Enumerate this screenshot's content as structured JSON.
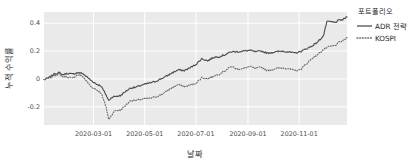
{
  "chart_data": {
    "type": "line",
    "title": "",
    "xlabel": "날짜",
    "ylabel": "누적 수익률",
    "legend_title": "포트폴리오",
    "legend_position": "right-outside",
    "grid": true,
    "grid_color": "#ffffff",
    "plot_bg": "#eaeaea",
    "figure_bg": "#ffffff",
    "xlim": [
      "2020-01-02",
      "2020-12-28"
    ],
    "ylim": [
      -0.33,
      0.48
    ],
    "yticks": [
      -0.2,
      0,
      0.2,
      0.4
    ],
    "ytick_labels": [
      "-0.2",
      "0",
      "0.2",
      "0.4"
    ],
    "xticks": [
      "2020-03-01",
      "2020-05-01",
      "2020-07-01",
      "2020-09-01",
      "2020-11-01"
    ],
    "xtick_labels": [
      "2020-03-01",
      "2020-05-01",
      "2020-07-01",
      "2020-09-01",
      "2020-11-01"
    ],
    "series": [
      {
        "name": "ADR 전략",
        "linestyle": "solid",
        "color": "#4f4f4f",
        "x": [
          "2020-01-02",
          "2020-01-08",
          "2020-01-14",
          "2020-01-20",
          "2020-01-24",
          "2020-01-30",
          "2020-02-05",
          "2020-02-11",
          "2020-02-17",
          "2020-02-21",
          "2020-02-27",
          "2020-03-04",
          "2020-03-10",
          "2020-03-16",
          "2020-03-19",
          "2020-03-23",
          "2020-03-27",
          "2020-04-02",
          "2020-04-08",
          "2020-04-14",
          "2020-04-20",
          "2020-04-27",
          "2020-05-06",
          "2020-05-13",
          "2020-05-20",
          "2020-05-27",
          "2020-06-03",
          "2020-06-10",
          "2020-06-17",
          "2020-06-24",
          "2020-07-01",
          "2020-07-08",
          "2020-07-15",
          "2020-07-22",
          "2020-07-29",
          "2020-08-05",
          "2020-08-12",
          "2020-08-20",
          "2020-08-27",
          "2020-09-03",
          "2020-09-10",
          "2020-09-17",
          "2020-09-24",
          "2020-10-05",
          "2020-10-12",
          "2020-10-19",
          "2020-10-26",
          "2020-11-02",
          "2020-11-09",
          "2020-11-16",
          "2020-11-23",
          "2020-11-30",
          "2020-12-04",
          "2020-12-09",
          "2020-12-14",
          "2020-12-18",
          "2020-12-23",
          "2020-12-28"
        ],
        "values": [
          -0.005,
          0.01,
          0.035,
          0.045,
          0.03,
          0.04,
          0.035,
          0.045,
          0.04,
          0.02,
          -0.01,
          -0.035,
          -0.05,
          -0.115,
          -0.155,
          -0.13,
          -0.125,
          -0.12,
          -0.09,
          -0.065,
          -0.06,
          -0.045,
          -0.03,
          -0.02,
          0.0,
          0.02,
          0.045,
          0.065,
          0.06,
          0.08,
          0.105,
          0.145,
          0.13,
          0.155,
          0.16,
          0.175,
          0.195,
          0.195,
          0.2,
          0.205,
          0.195,
          0.2,
          0.185,
          0.195,
          0.2,
          0.195,
          0.185,
          0.195,
          0.215,
          0.235,
          0.265,
          0.31,
          0.41,
          0.41,
          0.405,
          0.42,
          0.425,
          0.445
        ]
      },
      {
        "name": "KOSPI",
        "linestyle": "dotted",
        "color": "#6b6b6b",
        "x": [
          "2020-01-02",
          "2020-01-08",
          "2020-01-14",
          "2020-01-20",
          "2020-01-24",
          "2020-01-30",
          "2020-02-05",
          "2020-02-11",
          "2020-02-17",
          "2020-02-21",
          "2020-02-27",
          "2020-03-04",
          "2020-03-10",
          "2020-03-16",
          "2020-03-19",
          "2020-03-23",
          "2020-03-27",
          "2020-04-02",
          "2020-04-08",
          "2020-04-14",
          "2020-04-20",
          "2020-04-27",
          "2020-05-06",
          "2020-05-13",
          "2020-05-20",
          "2020-05-27",
          "2020-06-03",
          "2020-06-10",
          "2020-06-17",
          "2020-06-24",
          "2020-07-01",
          "2020-07-08",
          "2020-07-15",
          "2020-07-22",
          "2020-07-29",
          "2020-08-05",
          "2020-08-12",
          "2020-08-20",
          "2020-08-27",
          "2020-09-03",
          "2020-09-10",
          "2020-09-17",
          "2020-09-24",
          "2020-10-05",
          "2020-10-12",
          "2020-10-19",
          "2020-10-26",
          "2020-11-02",
          "2020-11-09",
          "2020-11-16",
          "2020-11-23",
          "2020-11-30",
          "2020-12-04",
          "2020-12-09",
          "2020-12-14",
          "2020-12-18",
          "2020-12-23",
          "2020-12-28"
        ],
        "values": [
          -0.005,
          0.005,
          0.025,
          0.035,
          0.015,
          0.015,
          0.005,
          0.03,
          0.02,
          -0.01,
          -0.055,
          -0.075,
          -0.1,
          -0.2,
          -0.29,
          -0.255,
          -0.225,
          -0.225,
          -0.19,
          -0.155,
          -0.155,
          -0.145,
          -0.14,
          -0.13,
          -0.115,
          -0.09,
          -0.06,
          -0.04,
          -0.055,
          -0.045,
          -0.03,
          0.01,
          0.0,
          0.02,
          0.035,
          0.06,
          0.09,
          0.07,
          0.075,
          0.09,
          0.075,
          0.085,
          0.06,
          0.075,
          0.08,
          0.075,
          0.06,
          0.065,
          0.105,
          0.145,
          0.175,
          0.21,
          0.225,
          0.235,
          0.24,
          0.26,
          0.275,
          0.295
        ]
      }
    ]
  },
  "legend": {
    "title": "포트폴리오",
    "items": [
      {
        "label": "ADR 전략",
        "style": "solid"
      },
      {
        "label": "KOSPI",
        "style": "dotted"
      }
    ]
  },
  "axes": {
    "xlabel": "날짜",
    "ylabel": "누적 수익률"
  }
}
